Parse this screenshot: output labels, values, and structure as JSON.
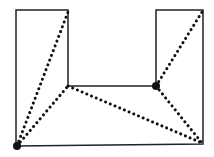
{
  "diagram": {
    "type": "polygon-triangulation",
    "colors": {
      "stroke": "#222222",
      "background": "#ffffff"
    },
    "polygon": [
      [
        16,
        146
      ],
      [
        16,
        10
      ],
      [
        68,
        10
      ],
      [
        68,
        86
      ],
      [
        156,
        86
      ],
      [
        156,
        10
      ],
      [
        203,
        10
      ],
      [
        203,
        144
      ]
    ],
    "vertices_marked": [
      {
        "x": 17,
        "y": 146,
        "r": 4
      },
      {
        "x": 156,
        "y": 86,
        "r": 4
      }
    ],
    "diagonals": [
      {
        "x1": 17,
        "y1": 146,
        "x2": 68,
        "y2": 12
      },
      {
        "x1": 17,
        "y1": 146,
        "x2": 68,
        "y2": 86
      },
      {
        "x1": 68,
        "y1": 86,
        "x2": 202,
        "y2": 143
      },
      {
        "x1": 156,
        "y1": 86,
        "x2": 202,
        "y2": 12
      },
      {
        "x1": 156,
        "y1": 86,
        "x2": 202,
        "y2": 143
      }
    ]
  }
}
